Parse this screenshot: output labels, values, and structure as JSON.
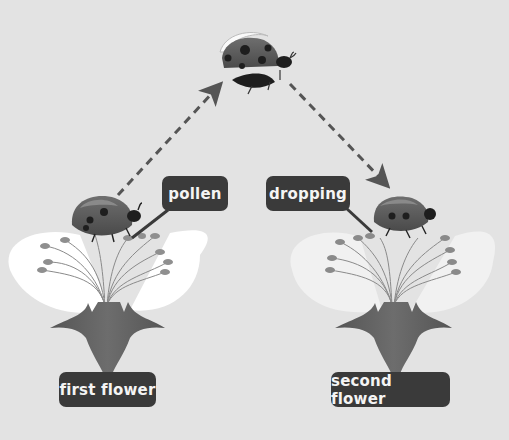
{
  "diagram": {
    "labels": {
      "pollen": "pollen",
      "dropping": "dropping",
      "first_flower": "first flower",
      "second_flower": "second flower"
    },
    "colors": {
      "background": "#e3e3e3",
      "label_bg": "#3a3a3a",
      "label_text": "#f4f4f4",
      "arrow": "#555555",
      "petal_first": "#ffffff",
      "petal_second": "#f1f1f1",
      "stem": "#5f5f5f",
      "ladybird_body": "#5a5a5a",
      "ladybird_spots": "#1e1e1e"
    },
    "flow": [
      "first flower",
      "ladybird flying",
      "second flower"
    ]
  }
}
